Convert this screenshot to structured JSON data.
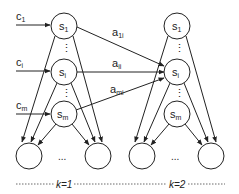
{
  "diagram": {
    "inputs": [
      {
        "label": "c",
        "sub": "1"
      },
      {
        "label": "c",
        "sub": "i"
      },
      {
        "label": "c",
        "sub": "m"
      }
    ],
    "columns": [
      {
        "nodes": [
          {
            "label": "s",
            "sub": "1"
          },
          {
            "label": "s",
            "sub": "i"
          },
          {
            "label": "s",
            "sub": "m"
          }
        ],
        "stage_label": "k=1"
      },
      {
        "nodes": [
          {
            "label": "s",
            "sub": "1"
          },
          {
            "label": "s",
            "sub": "i"
          },
          {
            "label": "s",
            "sub": "m"
          }
        ],
        "stage_label": "k=2"
      }
    ],
    "edges": [
      {
        "label": "a",
        "sub": "1i"
      },
      {
        "label": "a",
        "sub": "ii"
      },
      {
        "label": "a",
        "sub": "mi"
      }
    ],
    "vdots": "⋮",
    "hdots": "...",
    "colors": {
      "stroke": "#222222",
      "background": "#ffffff"
    }
  }
}
